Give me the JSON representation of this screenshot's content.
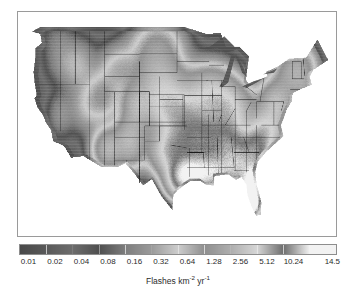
{
  "figure": {
    "title": "",
    "background_color": "#ffffff"
  },
  "map": {
    "name": "Contiguous United States lightning flash density map",
    "region": "Contiguous United States",
    "frame_color": "#9a9a9a",
    "ocean_color": "#ffffff",
    "border_color": "#1a1a1a",
    "description": "Grayscale raster of mean annual lightning flash density over the contiguous United States with state boundaries overlaid"
  },
  "colorbar": {
    "orientation": "horizontal",
    "scale": "log2",
    "axis_label_text": "Flashes km",
    "axis_label_sup1": "-2",
    "axis_label_mid": " yr",
    "axis_label_sup2": "-1",
    "tick_labels": [
      "0.01",
      "0.02",
      "0.04",
      "0.08",
      "0.16",
      "0.32",
      "0.64",
      "1.28",
      "2.56",
      "5.12",
      "10.24",
      "14.5"
    ],
    "vmin": "0.01",
    "vmax": "14.5"
  },
  "chart_data": {
    "type": "heatmap",
    "title": "",
    "subtitle": "",
    "xlabel": "",
    "ylabel": "",
    "colorbar_label": "Flashes km^-2 yr^-1",
    "colorbar_ticks": [
      0.01,
      0.02,
      0.04,
      0.08,
      0.16,
      0.32,
      0.64,
      1.28,
      2.56,
      5.12,
      10.24,
      14.5
    ],
    "colorbar_tick_labels": [
      "0.01",
      "0.02",
      "0.04",
      "0.08",
      "0.16",
      "0.32",
      "0.64",
      "1.28",
      "2.56",
      "5.12",
      "10.24",
      "14.5"
    ],
    "color_scale": "log2",
    "colormap": "grayscale-cyclic",
    "vmin": 0.01,
    "vmax": 14.5,
    "grid": false,
    "legend_position": "bottom",
    "colorbar_stop_grays": [
      "#4a4a4a",
      "#5a5a5a",
      "#6d6d6d",
      "#4f4f4f",
      "#7e7e7e",
      "#9b9b9b",
      "#cdcdcd",
      "#8f8f8f",
      "#aeaeae",
      "#d6d6d6",
      "#6e6e6e",
      "#f2f2f2"
    ],
    "regional_values": [
      {
        "region": "Florida peninsula",
        "value": 14.5
      },
      {
        "region": "Gulf Coast (Louisiana, Mississippi, Alabama)",
        "value": 10.24
      },
      {
        "region": "Southeast interior (Georgia, South Carolina)",
        "value": 5.12
      },
      {
        "region": "Texas Gulf Coast",
        "value": 5.12
      },
      {
        "region": "Southern Great Plains (Oklahoma, Arkansas)",
        "value": 2.56
      },
      {
        "region": "Midwest (Missouri, Kentucky, Tennessee)",
        "value": 2.56
      },
      {
        "region": "Ohio Valley",
        "value": 1.28
      },
      {
        "region": "Central Great Plains (Kansas, Nebraska)",
        "value": 1.28
      },
      {
        "region": "Northern Great Plains (Dakotas)",
        "value": 0.64
      },
      {
        "region": "Rocky Mountains (Colorado, New Mexico)",
        "value": 0.64
      },
      {
        "region": "Great Lakes water surfaces",
        "value": 0.32
      },
      {
        "region": "Northeast (New York, New England)",
        "value": 0.32
      },
      {
        "region": "Great Basin (Nevada, Utah)",
        "value": 0.16
      },
      {
        "region": "Pacific Northwest (Washington, Oregon)",
        "value": 0.04
      },
      {
        "region": "California coast",
        "value": 0.02
      },
      {
        "region": "Offshore Pacific",
        "value": 0.01
      }
    ]
  }
}
